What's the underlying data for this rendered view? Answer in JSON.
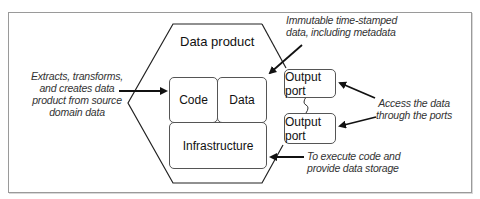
{
  "diagram": {
    "title": "Data product",
    "components": {
      "code": "Code",
      "data": "Data",
      "infrastructure": "Infrastructure",
      "output_port_1": "Output port",
      "output_port_2": "Output port"
    },
    "annotations": {
      "left": [
        "Extracts, transforms,",
        "and creates data",
        "product from source",
        "domain data"
      ],
      "top_right": [
        "Immutable time-stamped",
        "data, including metadata"
      ],
      "right": [
        "Access the data",
        "through the ports"
      ],
      "bottom_right": [
        "To execute code and",
        "provide data storage"
      ]
    },
    "colors": {
      "line": "#222222",
      "box_border": "#555555",
      "frame_border": "#9a9a9a"
    }
  }
}
